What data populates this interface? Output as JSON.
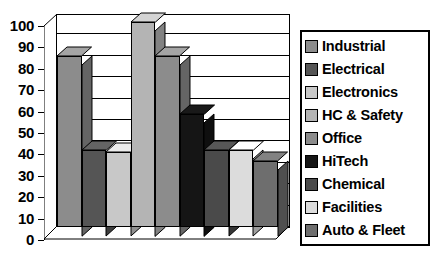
{
  "chart_data": {
    "type": "bar",
    "title": "",
    "subtitle": "",
    "xlabel": "",
    "ylabel": "",
    "ylim": [
      0,
      100
    ],
    "ytick_labels": [
      "100",
      "90",
      "80",
      "70",
      "60",
      "50",
      "40",
      "30",
      "20",
      "10",
      "0"
    ],
    "ytick_values": [
      100,
      90,
      80,
      70,
      60,
      50,
      40,
      30,
      20,
      10,
      0
    ],
    "grid": true,
    "legend_position": "right",
    "style": "3d-bar",
    "categories": [
      "Industrial",
      "Electrical",
      "Electronics",
      "HC & Safety",
      "Office",
      "HiTech",
      "Chemical",
      "Facilities",
      "Auto & Fleet"
    ],
    "values": [
      80,
      36,
      35,
      96,
      80,
      53,
      36,
      36,
      31
    ],
    "colors": [
      "#8c8c8c",
      "#555555",
      "#c8c8c8",
      "#b4b4b4",
      "#8c8c8c",
      "#151515",
      "#4a4a4a",
      "#dcdcdc",
      "#6e6e6e"
    ],
    "bars": [
      {
        "label": "Industrial",
        "value": 80,
        "color": "#8c8c8c"
      },
      {
        "label": "Electrical",
        "value": 36,
        "color": "#555555"
      },
      {
        "label": "Electronics",
        "value": 35,
        "color": "#c8c8c8"
      },
      {
        "label": "HC & Safety",
        "value": 96,
        "color": "#b4b4b4"
      },
      {
        "label": "Office",
        "value": 80,
        "color": "#8c8c8c"
      },
      {
        "label": "HiTech",
        "value": 53,
        "color": "#151515"
      },
      {
        "label": "Chemical",
        "value": 36,
        "color": "#4a4a4a"
      },
      {
        "label": "Facilities",
        "value": 36,
        "color": "#dcdcdc"
      },
      {
        "label": "Auto & Fleet",
        "value": 31,
        "color": "#6e6e6e"
      }
    ]
  },
  "legend": {
    "items": [
      {
        "label": "Industrial",
        "color": "#8c8c8c"
      },
      {
        "label": "Electrical",
        "color": "#555555"
      },
      {
        "label": "Electronics",
        "color": "#c8c8c8"
      },
      {
        "label": "HC & Safety",
        "color": "#b4b4b4"
      },
      {
        "label": "Office",
        "color": "#8c8c8c"
      },
      {
        "label": "HiTech",
        "color": "#151515"
      },
      {
        "label": "Chemical",
        "color": "#4a4a4a"
      },
      {
        "label": "Facilities",
        "color": "#dcdcdc"
      },
      {
        "label": "Auto & Fleet",
        "color": "#6e6e6e"
      }
    ]
  },
  "axis": {
    "y_labels": [
      "100",
      "90",
      "80",
      "70",
      "60",
      "50",
      "40",
      "30",
      "20",
      "10",
      "0"
    ]
  }
}
